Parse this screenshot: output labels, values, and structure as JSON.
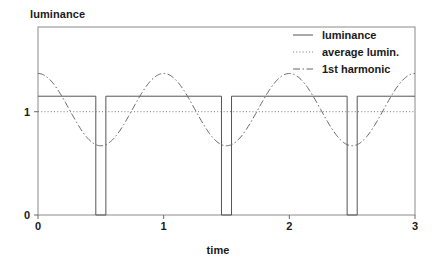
{
  "chart_data": {
    "type": "line",
    "title": "",
    "xlabel": "time",
    "ylabel": "luminance",
    "xlim": [
      0,
      3
    ],
    "ylim": [
      0,
      1.82
    ],
    "xticks": [
      "0",
      "1",
      "2",
      "3"
    ],
    "xtick_values": [
      0,
      1,
      2,
      3
    ],
    "yticks": [
      "0",
      "1"
    ],
    "ytick_values": [
      0,
      1
    ],
    "grid": false,
    "legend_position": "top-right",
    "series": [
      {
        "name": "luminance",
        "style": "solid",
        "color": "#555555",
        "description": "square wave, high level 1.15, low level 0, narrow low pulses",
        "high_level": 1.15,
        "low_level": 0,
        "pulse_edges": [
          0.46,
          0.54,
          1.46,
          1.54,
          2.46,
          2.54
        ],
        "x": [
          0,
          0.46,
          0.46,
          0.54,
          0.54,
          1.46,
          1.46,
          1.54,
          1.54,
          2.46,
          2.46,
          2.54,
          2.54,
          3
        ],
        "values": [
          1.15,
          1.15,
          0,
          0,
          1.15,
          1.15,
          0,
          0,
          1.15,
          1.15,
          0,
          0,
          1.15,
          1.15
        ]
      },
      {
        "name": "average lumin.",
        "style": "dotted",
        "color": "#777777",
        "description": "horizontal constant line at the mean luminance",
        "constant_value": 1.0
      },
      {
        "name": "1st harmonic",
        "style": "dashdot",
        "color": "#666666",
        "description": "cosine at fundamental frequency, mean 1.02, amplitude 0.35, period 1",
        "mean": 1.02,
        "amplitude": 0.35,
        "period": 1.0,
        "phase": 0,
        "peaks_at": [
          0,
          1,
          2,
          3
        ],
        "troughs_at": [
          0.5,
          1.5,
          2.5
        ],
        "peak_value": 1.37,
        "trough_value": 0.67
      }
    ]
  },
  "legend": {
    "items": [
      {
        "label": "luminance",
        "style": "solid"
      },
      {
        "label": "average lumin.",
        "style": "dotted"
      },
      {
        "label": "1st harmonic",
        "style": "dashdot"
      }
    ]
  }
}
